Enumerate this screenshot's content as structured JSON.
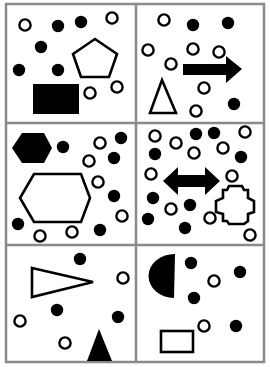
{
  "colors": {
    "background": "#ffffff",
    "grid_line": "#8a8a8a",
    "shape_fill": "#000000",
    "shape_stroke": "#000000"
  },
  "grid": {
    "rows": 3,
    "cols": 2,
    "x": [
      6,
      136,
      264
    ],
    "y": [
      4,
      123,
      245,
      362
    ]
  },
  "panels": [
    {
      "id": "panel-1",
      "open_circles": [
        [
          25,
          25
        ],
        [
          112,
          18
        ],
        [
          90,
          93
        ],
        [
          117,
          87
        ]
      ],
      "filled_circles": [
        [
          58,
          26
        ],
        [
          81,
          22
        ],
        [
          41,
          47
        ],
        [
          19,
          70
        ],
        [
          58,
          70
        ]
      ],
      "shapes": [
        {
          "type": "pentagon",
          "fill": "none",
          "points": "95,39 117,54 109,77 81,77 73,54"
        },
        {
          "type": "rectangle",
          "fill": "black",
          "x": 33,
          "y": 84,
          "w": 46,
          "h": 30
        }
      ]
    },
    {
      "id": "panel-2",
      "open_circles": [
        [
          164,
          20
        ],
        [
          148,
          50
        ],
        [
          193,
          49
        ],
        [
          219,
          52
        ],
        [
          171,
          64
        ],
        [
          204,
          88
        ],
        [
          196,
          111
        ]
      ],
      "filled_circles": [
        [
          193,
          25
        ],
        [
          228,
          23
        ],
        [
          234,
          104
        ]
      ],
      "shapes": [
        {
          "type": "arrow-right",
          "fill": "black",
          "points": "183,64 226,64 226,56 242,69 226,83 226,75 183,75"
        },
        {
          "type": "triangle",
          "fill": "none",
          "points": "150,113 162,80 176,113"
        }
      ]
    },
    {
      "id": "panel-3",
      "open_circles": [
        [
          100,
          143
        ],
        [
          89,
          161
        ],
        [
          98,
          182
        ],
        [
          122,
          216
        ],
        [
          40,
          236
        ],
        [
          72,
          232
        ]
      ],
      "filled_circles": [
        [
          63,
          147
        ],
        [
          121,
          138
        ],
        [
          114,
          158
        ],
        [
          114,
          196
        ],
        [
          18,
          224
        ],
        [
          100,
          230
        ]
      ],
      "shapes": [
        {
          "type": "hexagon",
          "fill": "black",
          "points": "12,148 22,133 44,133 52,148 44,163 22,163"
        },
        {
          "type": "hexagon",
          "fill": "none",
          "points": "20,198 34,174 81,174 90,198 81,222 34,222"
        }
      ]
    },
    {
      "id": "panel-4",
      "open_circles": [
        [
          155,
          136
        ],
        [
          176,
          143
        ],
        [
          245,
          132
        ],
        [
          223,
          148
        ],
        [
          194,
          153
        ],
        [
          151,
          174
        ],
        [
          232,
          176
        ],
        [
          171,
          209
        ],
        [
          210,
          218
        ],
        [
          250,
          235
        ]
      ],
      "filled_circles": [
        [
          196,
          134
        ],
        [
          214,
          133
        ],
        [
          155,
          154
        ],
        [
          241,
          157
        ],
        [
          153,
          198
        ],
        [
          190,
          205
        ],
        [
          148,
          219
        ],
        [
          185,
          228
        ]
      ],
      "shapes": [
        {
          "type": "double-arrow",
          "fill": "black",
          "points": "163,181 178,167 178,175 205,175 205,167 220,181 205,195 205,187 178,187 178,195"
        },
        {
          "type": "cross-octagon",
          "fill": "none",
          "points": "223,190 227,190 229,186 242,186 244,190 248,190 248,198 254,201 254,212 248,214 248,221 244,224 229,224 227,221 223,221 223,214 216,212 216,201 223,198"
        }
      ]
    },
    {
      "id": "panel-5",
      "open_circles": [
        [
          123,
          278
        ],
        [
          20,
          321
        ],
        [
          65,
          343
        ]
      ],
      "filled_circles": [
        [
          80,
          259
        ],
        [
          57,
          310
        ],
        [
          118,
          317
        ]
      ],
      "shapes": [
        {
          "type": "triangle",
          "fill": "none",
          "points": "32,268 93,282 32,297"
        },
        {
          "type": "triangle",
          "fill": "black",
          "points": "87,361 99,329 112,361"
        }
      ]
    },
    {
      "id": "panel-6",
      "open_circles": [
        [
          214,
          281
        ],
        [
          204,
          326
        ]
      ],
      "filled_circles": [
        [
          191,
          263
        ],
        [
          240,
          272
        ],
        [
          194,
          298
        ],
        [
          236,
          326
        ]
      ],
      "shapes": [
        {
          "type": "half-disc",
          "fill": "black",
          "path": "M175,254 L174,298 A26,22 0 0 1 175,254 Z"
        },
        {
          "type": "rectangle",
          "fill": "none",
          "x": 161,
          "y": 331,
          "w": 32,
          "h": 21
        }
      ]
    }
  ]
}
